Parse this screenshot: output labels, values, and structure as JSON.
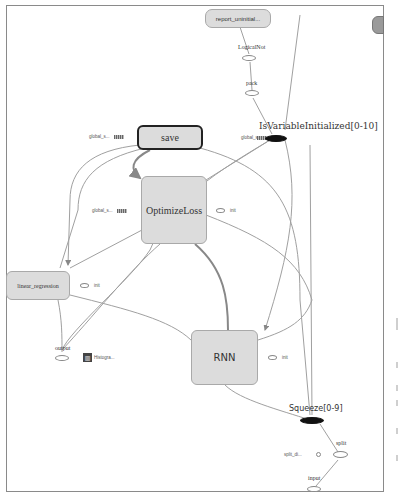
{
  "graph": {
    "nodes": {
      "report_uninitialized": {
        "label": "report_uninitial..."
      },
      "partial_right": {
        "label": "E"
      },
      "logical_not": {
        "label": "LogicalNot"
      },
      "pack": {
        "label": "pack"
      },
      "is_variable_initialized": {
        "label": "IsVariableInitialized[0-10]"
      },
      "save": {
        "label": "save"
      },
      "optimize_loss": {
        "label": "OptimizeLoss"
      },
      "linear_regression": {
        "label": "linear_regression"
      },
      "rnn": {
        "label": "RNN"
      },
      "output": {
        "label": "output"
      },
      "histogram": {
        "label": "Histogra..."
      },
      "squeeze": {
        "label": "Squeeze[0-9]"
      },
      "split": {
        "label": "split"
      },
      "split_dim": {
        "label": "split_di..."
      },
      "input": {
        "label": "input"
      }
    },
    "aux_labels": {
      "save_global_step": "global_s...",
      "is_var_global_step": "global_s...",
      "optimize_global_step": "global_s...",
      "optimize_init": "init",
      "linear_init": "init",
      "rnn_init": "init"
    },
    "colors": {
      "node_fill": "#dcdcdc",
      "node_border": "#a9a9a9",
      "selected_border": "#222222",
      "edge": "#9a9a9a",
      "series_node": "#111111"
    }
  }
}
